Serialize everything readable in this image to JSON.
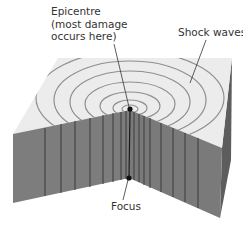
{
  "diagram": {
    "labels": {
      "epicentre": [
        "Epicentre",
        "(most damage",
        "occurs here)"
      ],
      "shock_waves": "Shock waves",
      "focus": "Focus"
    },
    "colors": {
      "top_face": "#ececec",
      "side_face": "#7e7e7e",
      "side_face_dark": "#5a5a5a",
      "rings": "#8f8f8f",
      "lines": "#333333",
      "point": "#111111"
    },
    "ring_count": 7
  }
}
